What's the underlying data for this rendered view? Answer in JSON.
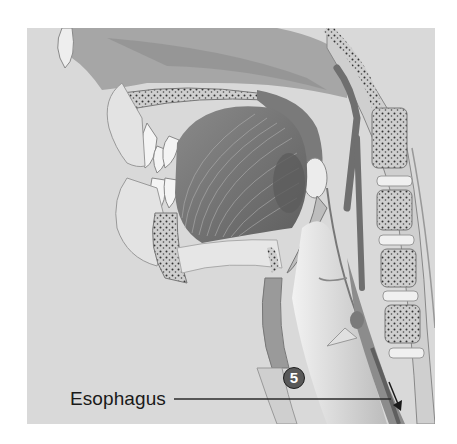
{
  "figure": {
    "label": "Esophagus",
    "step_badge": "5",
    "colors": {
      "background": "#d9d9d9",
      "tissue_light": "#eeeeee",
      "tissue_mid": "#a9a9a9",
      "tissue_dark": "#6f6f6f",
      "badge_fill": "#595959",
      "leader_line": "#2a2a2a"
    }
  }
}
